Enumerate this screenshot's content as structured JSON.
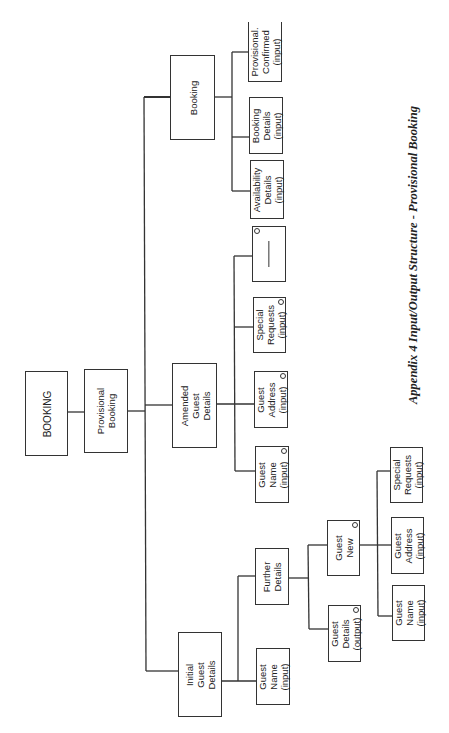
{
  "diagram": {
    "type": "hierarchy",
    "orientation": "rotated-90-ccw",
    "caption": "Appendix 4 Input/Output Structure - Provisional Booking",
    "root": {
      "label": "BOOKING",
      "children": [
        {
          "label": "Provisional\nBooking",
          "children": [
            {
              "label": "Initial\nGuest\nDetails",
              "children": [
                {
                  "label": "Guest\nName\n(input)"
                },
                {
                  "label": "Further\nDetails",
                  "children": [
                    {
                      "label": "Guest\nDetails\n(output)",
                      "marker": "o"
                    },
                    {
                      "label": "Guest\nNew",
                      "marker": "o",
                      "children": [
                        {
                          "label": "Guest\nName\n(input)"
                        },
                        {
                          "label": "Guest\nAddress\n(input)"
                        },
                        {
                          "label": "Special\nRequests\n(input)"
                        }
                      ]
                    }
                  ]
                }
              ]
            },
            {
              "label": "Amended\nGuest\nDetails",
              "children": [
                {
                  "label": "Guest\nName\n(input)",
                  "marker": "o"
                },
                {
                  "label": "Guest\nAddress\n(input)",
                  "marker": "o"
                },
                {
                  "label": "Special\nRequests\n(input)",
                  "marker": "o"
                },
                {
                  "label": "",
                  "marker": "o",
                  "note": "null selection (—)"
                }
              ]
            },
            {
              "label": "Booking",
              "children": [
                {
                  "label": "Availability\nDetails\n(input)"
                },
                {
                  "label": "Booking\nDetails\n(input)"
                },
                {
                  "label": "Provisional.\nConfirmed\n(input)"
                }
              ]
            }
          ]
        }
      ]
    }
  },
  "nodes": {
    "booking_root": "BOOKING",
    "provisional_booking": "Provisional\nBooking",
    "initial_guest_details": "Initial\nGuest\nDetails",
    "amended_guest_details": "Amended\nGuest\nDetails",
    "booking": "Booking",
    "initial_guest_name": "Guest\nName\n(input)",
    "further_details": "Further\nDetails",
    "guest_details_output": "Guest\nDetails\n(output)",
    "guest_new": "Guest\nNew",
    "new_guest_name": "Guest\nName\n(input)",
    "new_guest_address": "Guest\nAddress\n(input)",
    "new_special_requests": "Special\nRequests\n(input)",
    "amended_guest_name": "Guest\nName\n(input)",
    "amended_guest_address": "Guest\nAddress\n(input)",
    "amended_special_requests": "Special\nRequests\n(input)",
    "availability_details": "Availability\nDetails\n(input)",
    "booking_details": "Booking\nDetails\n(input)",
    "provisional_confirmed": "Provisional.\nConfirmed\n(input)"
  },
  "caption": "Appendix 4 Input/Output Structure - Provisional Booking",
  "colors": {
    "line": "#333333",
    "background": "#ffffff",
    "text": "#222222"
  }
}
